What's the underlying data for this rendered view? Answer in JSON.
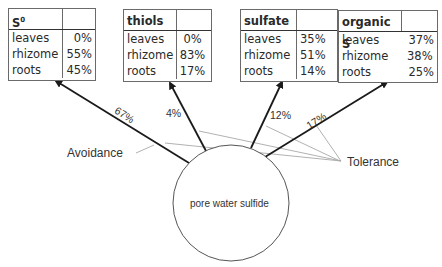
{
  "tables": [
    {
      "name": "S",
      "name_sup": "0",
      "rows": [
        {
          "label": "leaves",
          "value": "0%"
        },
        {
          "label": "rhizome",
          "value": "55%"
        },
        {
          "label": "roots",
          "value": "45%"
        }
      ]
    },
    {
      "name": "thiols",
      "rows": [
        {
          "label": "leaves",
          "value": "0%"
        },
        {
          "label": "rhizome",
          "value": "83%"
        },
        {
          "label": "roots",
          "value": "17%"
        }
      ]
    },
    {
      "name": "sulfate",
      "rows": [
        {
          "label": "leaves",
          "value": "35%"
        },
        {
          "label": "rhizome",
          "value": "51%"
        },
        {
          "label": "roots",
          "value": "14%"
        }
      ]
    },
    {
      "name": "organic S",
      "rows": [
        {
          "label": "leaves",
          "value": "37%"
        },
        {
          "label": "rhizome",
          "value": "38%"
        },
        {
          "label": "roots",
          "value": "25%"
        }
      ]
    }
  ],
  "arrows": [
    {
      "target": "S0",
      "percent": "67%"
    },
    {
      "target": "thiols",
      "percent": "4%"
    },
    {
      "target": "sulfate",
      "percent": "12%"
    },
    {
      "target": "organic S",
      "percent": "17%"
    }
  ],
  "labels": {
    "avoidance": "Avoidance",
    "tolerance": "Tolerance",
    "center": "pore water sulfide"
  },
  "colors": {
    "arrow": "#1a1a1a",
    "callout_line": "#a0a0a0",
    "table_border": "#6a6a6a",
    "circle": "#555555"
  }
}
